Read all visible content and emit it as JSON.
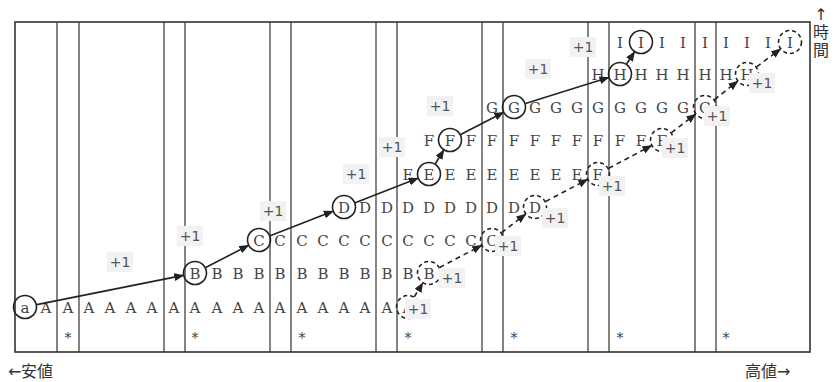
{
  "labels": {
    "low_value": "←安値",
    "high_value": "高値→",
    "time_arrow": "↑",
    "time": "時間"
  },
  "colors": {
    "line": "#333333",
    "text": "#444444",
    "plus_bg": "#f2f2f2"
  },
  "frame": {
    "x1": 15,
    "y1": 22,
    "x2": 810,
    "y2": 352
  },
  "separator_lines": [
    57,
    79,
    164,
    185,
    270,
    291,
    376,
    397,
    482,
    503,
    588,
    609,
    695,
    716
  ],
  "columns_x": [
    25,
    46,
    68,
    89,
    110,
    131,
    152,
    174,
    195,
    217,
    238,
    259,
    280,
    302,
    323,
    344,
    365,
    387,
    408,
    429,
    450,
    471,
    492,
    514,
    535,
    556,
    577,
    598,
    620,
    641,
    662,
    683,
    705,
    726,
    747,
    768,
    790
  ],
  "rows": [
    {
      "letter": "A",
      "y": 307,
      "start_col": 1
    },
    {
      "letter": "B",
      "y": 273,
      "start_col": 8
    },
    {
      "letter": "C",
      "y": 240,
      "start_col": 11
    },
    {
      "letter": "D",
      "y": 207,
      "start_col": 15
    },
    {
      "letter": "E",
      "y": 174,
      "start_col": 18
    },
    {
      "letter": "F",
      "y": 140,
      "start_col": 19
    },
    {
      "letter": "G",
      "y": 107,
      "start_col": 22
    },
    {
      "letter": "H",
      "y": 74,
      "start_col": 27
    },
    {
      "letter": "I",
      "y": 42,
      "start_col": 28
    }
  ],
  "origin": {
    "letter": "a",
    "col": 0,
    "y": 307
  },
  "asterisk_y": 337,
  "asterisk_cols": [
    2,
    8,
    13,
    18,
    23,
    28,
    33
  ],
  "solid_path": [
    {
      "letter": "a",
      "col": 0,
      "y": 307
    },
    {
      "letter": "B",
      "col": 8,
      "y": 273
    },
    {
      "letter": "C",
      "col": 11,
      "y": 240
    },
    {
      "letter": "D",
      "col": 15,
      "y": 207
    },
    {
      "letter": "E",
      "col": 19,
      "y": 174
    },
    {
      "letter": "F",
      "col": 20,
      "y": 140
    },
    {
      "letter": "G",
      "col": 23,
      "y": 107
    },
    {
      "letter": "H",
      "col": 28,
      "y": 74
    },
    {
      "letter": "I",
      "col": 29,
      "y": 42
    }
  ],
  "dashed_path": [
    {
      "letter": "A",
      "col": 18,
      "y": 307
    },
    {
      "letter": "B",
      "col": 19,
      "y": 273
    },
    {
      "letter": "C",
      "col": 22,
      "y": 240
    },
    {
      "letter": "D",
      "col": 24,
      "y": 207
    },
    {
      "letter": "E",
      "col": 27,
      "y": 174
    },
    {
      "letter": "F",
      "col": 30,
      "y": 140
    },
    {
      "letter": "G",
      "col": 32,
      "y": 107
    },
    {
      "letter": "H",
      "col": 34,
      "y": 74
    },
    {
      "letter": "I",
      "col": 36,
      "y": 42
    }
  ],
  "plus_labels": [
    {
      "text": "+1",
      "x": 120,
      "y": 262
    },
    {
      "text": "+1",
      "x": 190,
      "y": 236
    },
    {
      "text": "+1",
      "x": 273,
      "y": 211
    },
    {
      "text": "+1",
      "x": 356,
      "y": 174
    },
    {
      "text": "+1",
      "x": 392,
      "y": 147
    },
    {
      "text": "+1",
      "x": 440,
      "y": 106
    },
    {
      "text": "+1",
      "x": 538,
      "y": 69
    },
    {
      "text": "+1",
      "x": 583,
      "y": 47
    },
    {
      "text": "+1",
      "x": 418,
      "y": 309
    },
    {
      "text": "+1",
      "x": 452,
      "y": 278
    },
    {
      "text": "+1",
      "x": 508,
      "y": 246
    },
    {
      "text": "+1",
      "x": 555,
      "y": 218
    },
    {
      "text": "+1",
      "x": 612,
      "y": 186
    },
    {
      "text": "+1",
      "x": 675,
      "y": 148
    },
    {
      "text": "+1",
      "x": 717,
      "y": 116
    },
    {
      "text": "+1",
      "x": 762,
      "y": 83
    }
  ]
}
